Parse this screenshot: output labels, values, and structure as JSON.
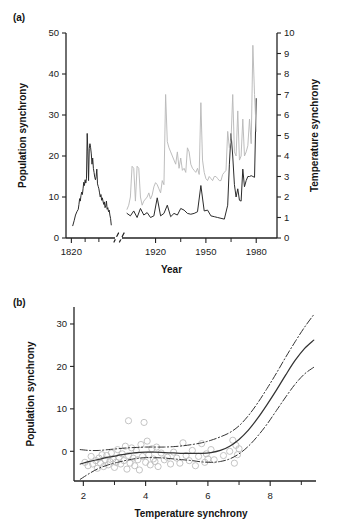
{
  "figure": {
    "panel_a_label": "(a)",
    "panel_b_label": "(b)"
  },
  "chart_data": [
    {
      "panel": "(a)",
      "type": "line",
      "title": "",
      "xlabel": "Year",
      "ylabel": "Population synchrony",
      "y2label": "Temperature synchrony",
      "xlim": [
        1818,
        1990
      ],
      "ylim": [
        0,
        50
      ],
      "y2lim": [
        0,
        10
      ],
      "xticks": [
        1820,
        1920,
        1950,
        1980
      ],
      "xticks_minor": [
        1840,
        1860,
        1935,
        1965
      ],
      "yticks": [
        0,
        10,
        20,
        30,
        40,
        50
      ],
      "y2ticks": [
        0,
        1,
        2,
        3,
        4,
        5,
        6,
        7,
        8,
        9,
        10
      ],
      "grid": false,
      "axis_break": {
        "present": true,
        "axis": "x",
        "location_between": [
          1880,
          1905
        ],
        "style": "double-slash"
      },
      "series": [
        {
          "name": "Population synchrony",
          "axis": "left",
          "color": "#2b2b2b",
          "style": "solid",
          "segments": [
            {
              "x": [
                1822,
                1824,
                1826,
                1828,
                1830,
                1831,
                1832,
                1833,
                1834,
                1835,
                1836,
                1837,
                1838,
                1839,
                1840,
                1841,
                1842,
                1843,
                1844,
                1845,
                1846,
                1847,
                1848,
                1849,
                1850,
                1851,
                1852,
                1853,
                1854,
                1855,
                1856,
                1857,
                1858,
                1859,
                1860,
                1861,
                1862,
                1863,
                1864,
                1865,
                1866,
                1867,
                1868,
                1869,
                1870,
                1871,
                1872,
                1873,
                1874,
                1875,
                1876,
                1877,
                1878
              ],
              "y": [
                3.0,
                4.2,
                5.6,
                6.4,
                7.0,
                8.2,
                9.6,
                9.0,
                10.4,
                11.2,
                10.6,
                12.0,
                13.6,
                12.8,
                14.2,
                13.4,
                14.6,
                25.5,
                21.0,
                14.0,
                21.8,
                23.0,
                22.0,
                20.5,
                18.0,
                19.5,
                17.0,
                16.0,
                14.8,
                14.2,
                15.0,
                16.8,
                13.2,
                12.6,
                12.0,
                11.0,
                10.0,
                10.6,
                9.2,
                9.8,
                9.0,
                8.2,
                8.8,
                7.4,
                7.8,
                9.0,
                7.0,
                7.4,
                6.4,
                6.8,
                5.6,
                4.8,
                3.2
              ]
            },
            {
              "x": [
                1903,
                1905,
                1907,
                1909,
                1911,
                1913,
                1915,
                1917,
                1919,
                1921,
                1923,
                1925,
                1927,
                1929,
                1931,
                1933,
                1935,
                1937,
                1939,
                1941,
                1943,
                1945,
                1947,
                1949,
                1951,
                1953,
                1955,
                1957,
                1959,
                1961,
                1963,
                1964,
                1965,
                1966,
                1967,
                1968,
                1969,
                1970,
                1971,
                1972,
                1973,
                1974,
                1975,
                1976,
                1977,
                1978,
                1979,
                1980
              ],
              "y": [
                6.0,
                5.4,
                6.6,
                5.0,
                7.2,
                5.6,
                6.2,
                5.0,
                5.4,
                9.8,
                5.4,
                6.0,
                8.0,
                5.2,
                6.0,
                5.6,
                7.2,
                6.8,
                6.0,
                5.8,
                6.0,
                6.4,
                12.8,
                6.6,
                6.8,
                5.4,
                5.2,
                5.0,
                4.8,
                4.6,
                8.0,
                18.0,
                25.5,
                20.0,
                13.0,
                10.0,
                12.0,
                9.2,
                9.0,
                16.8,
                12.5,
                14.0,
                15.0,
                15.0,
                15.2,
                15.0,
                14.8,
                34.0
              ]
            }
          ]
        },
        {
          "name": "Temperature synchrony",
          "axis": "right",
          "color": "#b9b9b9",
          "style": "solid",
          "segments": [
            {
              "x": [
                1903,
                1904,
                1905,
                1906,
                1907,
                1908,
                1909,
                1910,
                1911,
                1912,
                1913,
                1914,
                1915,
                1916,
                1917,
                1918,
                1919,
                1920,
                1921,
                1922,
                1923,
                1924,
                1925,
                1926,
                1927,
                1928,
                1929,
                1930,
                1931,
                1932,
                1933,
                1934,
                1935,
                1936,
                1937,
                1938,
                1939,
                1940,
                1941,
                1942,
                1943,
                1944,
                1945,
                1946,
                1947,
                1948,
                1949,
                1950,
                1951,
                1952,
                1953,
                1954,
                1955,
                1956,
                1957,
                1958,
                1959,
                1960,
                1961,
                1962,
                1963,
                1964,
                1965,
                1966,
                1967,
                1968,
                1969,
                1970,
                1971,
                1972,
                1973,
                1974,
                1975,
                1976,
                1977,
                1978,
                1979,
                1980
              ],
              "y": [
                1.4,
                1.6,
                2.0,
                3.5,
                3.4,
                1.8,
                3.5,
                3.4,
                2.0,
                1.6,
                1.8,
                1.9,
                2.0,
                2.2,
                1.9,
                2.1,
                2.5,
                2.7,
                2.6,
                2.4,
                2.2,
                2.8,
                2.6,
                7.0,
                4.7,
                4.4,
                4.2,
                4.0,
                3.8,
                3.6,
                4.2,
                3.4,
                3.9,
                3.3,
                3.4,
                3.2,
                4.4,
                4.2,
                3.6,
                3.4,
                3.3,
                3.2,
                3.4,
                3.1,
                6.6,
                3.8,
                3.2,
                2.9,
                2.8,
                3.0,
                2.9,
                2.8,
                3.0,
                3.0,
                2.9,
                2.8,
                2.8,
                3.1,
                3.2,
                3.3,
                5.2,
                4.4,
                4.8,
                7.0,
                4.2,
                4.0,
                6.2,
                3.8,
                4.0,
                5.8,
                4.0,
                4.2,
                4.5,
                5.8,
                4.6,
                9.4,
                7.0,
                5.2
              ]
            }
          ]
        }
      ]
    },
    {
      "panel": "(b)",
      "type": "scatter",
      "title": "",
      "xlabel": "Temperature synchrony",
      "ylabel": "Population synchrony",
      "xlim": [
        1.7,
        9.6
      ],
      "ylim": [
        -7,
        34
      ],
      "xticks": [
        2,
        4,
        6,
        8
      ],
      "xticks_minor": [
        3,
        5,
        7,
        9
      ],
      "yticks": [
        0,
        10,
        20,
        30
      ],
      "grid": false,
      "marker": "open-circle",
      "points": [
        [
          2.05,
          -2.6
        ],
        [
          2.15,
          -3.4
        ],
        [
          2.25,
          -1.2
        ],
        [
          2.3,
          -3.0
        ],
        [
          2.4,
          -2.2
        ],
        [
          2.45,
          -4.0
        ],
        [
          2.5,
          -1.6
        ],
        [
          2.55,
          -2.8
        ],
        [
          2.6,
          -0.8
        ],
        [
          2.65,
          -3.6
        ],
        [
          2.7,
          -2.0
        ],
        [
          2.75,
          -1.0
        ],
        [
          2.8,
          -3.2
        ],
        [
          2.85,
          -2.4
        ],
        [
          2.9,
          -0.4
        ],
        [
          2.95,
          -1.8
        ],
        [
          3.0,
          -3.8
        ],
        [
          3.05,
          -2.6
        ],
        [
          3.1,
          0.4
        ],
        [
          3.15,
          -1.4
        ],
        [
          3.2,
          -3.0
        ],
        [
          3.25,
          -0.6
        ],
        [
          3.3,
          -2.2
        ],
        [
          3.35,
          1.2
        ],
        [
          3.4,
          -4.2
        ],
        [
          3.45,
          -1.0
        ],
        [
          3.45,
          7.2
        ],
        [
          3.5,
          -2.8
        ],
        [
          3.55,
          0.8
        ],
        [
          3.6,
          -1.6
        ],
        [
          3.65,
          -3.4
        ],
        [
          3.7,
          0.2
        ],
        [
          3.75,
          -2.0
        ],
        [
          3.8,
          -4.4
        ],
        [
          3.85,
          1.6
        ],
        [
          3.9,
          -1.2
        ],
        [
          3.95,
          6.8
        ],
        [
          4.0,
          -2.6
        ],
        [
          4.05,
          2.4
        ],
        [
          4.1,
          -0.8
        ],
        [
          4.15,
          -3.2
        ],
        [
          4.2,
          0.6
        ],
        [
          4.25,
          -1.8
        ],
        [
          4.3,
          -2.4
        ],
        [
          4.35,
          1.0
        ],
        [
          4.4,
          -3.6
        ],
        [
          4.5,
          -0.4
        ],
        [
          4.6,
          -2.0
        ],
        [
          4.7,
          -1.4
        ],
        [
          4.8,
          -3.0
        ],
        [
          4.9,
          -0.2
        ],
        [
          5.0,
          -1.6
        ],
        [
          5.1,
          -2.8
        ],
        [
          5.2,
          2.0
        ],
        [
          5.3,
          -1.0
        ],
        [
          5.4,
          -2.2
        ],
        [
          5.5,
          0.2
        ],
        [
          5.6,
          -3.4
        ],
        [
          5.7,
          -1.2
        ],
        [
          5.8,
          1.8
        ],
        [
          5.9,
          -2.6
        ],
        [
          5.95,
          -0.6
        ],
        [
          6.0,
          -1.8
        ],
        [
          6.1,
          0.4
        ],
        [
          6.2,
          -2.0
        ],
        [
          6.5,
          -1.0
        ],
        [
          6.7,
          0.0
        ],
        [
          6.8,
          2.6
        ],
        [
          6.85,
          -2.8
        ],
        [
          6.9,
          1.4
        ],
        [
          6.95,
          -0.8
        ],
        [
          7.0,
          0.6
        ]
      ],
      "fit_line": {
        "name": "GAM fit",
        "style": "solid",
        "x": [
          1.9,
          2.2,
          2.5,
          2.8,
          3.1,
          3.4,
          3.7,
          4.0,
          4.3,
          4.6,
          4.9,
          5.2,
          5.5,
          5.8,
          6.1,
          6.4,
          6.7,
          7.0,
          7.3,
          7.6,
          7.9,
          8.2,
          8.5,
          8.8,
          9.1,
          9.4
        ],
        "y": [
          -3.0,
          -2.4,
          -1.9,
          -1.4,
          -1.0,
          -0.6,
          -0.3,
          -0.2,
          -0.2,
          -0.3,
          -0.4,
          -0.5,
          -0.5,
          -0.5,
          -0.3,
          0.2,
          1.2,
          2.8,
          5.0,
          7.8,
          11.0,
          14.4,
          18.0,
          21.4,
          24.2,
          26.2
        ]
      },
      "confidence_bands": [
        {
          "name": "upper 95% CI",
          "style": "dash-dot",
          "x": [
            1.9,
            2.2,
            2.5,
            2.8,
            3.1,
            3.4,
            3.7,
            4.0,
            4.3,
            4.6,
            4.9,
            5.2,
            5.5,
            5.8,
            6.1,
            6.4,
            6.7,
            7.0,
            7.3,
            7.6,
            7.9,
            8.2,
            8.5,
            8.8,
            9.1,
            9.4
          ],
          "y": [
            0.4,
            0.2,
            0.2,
            0.4,
            0.6,
            0.8,
            0.9,
            1.0,
            1.0,
            1.0,
            1.1,
            1.3,
            1.6,
            2.0,
            2.6,
            3.4,
            4.4,
            6.0,
            8.4,
            11.4,
            14.8,
            18.4,
            22.2,
            25.8,
            29.2,
            32.2
          ]
        },
        {
          "name": "lower 95% CI",
          "style": "dash-dot",
          "x": [
            1.9,
            2.2,
            2.5,
            2.8,
            3.1,
            3.4,
            3.7,
            4.0,
            4.3,
            4.6,
            4.9,
            5.2,
            5.5,
            5.8,
            6.1,
            6.4,
            6.7,
            7.0,
            7.3,
            7.6,
            7.9,
            8.2,
            8.5,
            8.8,
            9.1,
            9.4
          ],
          "y": [
            -6.6,
            -5.2,
            -4.0,
            -3.2,
            -2.6,
            -2.1,
            -1.7,
            -1.5,
            -1.5,
            -1.6,
            -1.8,
            -2.0,
            -2.2,
            -2.5,
            -2.6,
            -2.4,
            -1.8,
            -0.6,
            1.2,
            3.6,
            6.4,
            9.6,
            12.8,
            15.8,
            18.2,
            19.8
          ]
        }
      ]
    }
  ]
}
